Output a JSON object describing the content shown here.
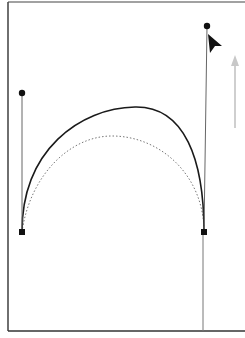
{
  "diagram": {
    "colors": {
      "frame": "#333333",
      "curve": "#1a1a1a",
      "dotted_curve": "#777777",
      "handle_line": "#666666",
      "anchor": "#111111",
      "cursor": "#111111",
      "drag_arrow": "#c8c8c8"
    },
    "frame": {
      "left": 8,
      "top": 2,
      "bottom": 331
    },
    "anchors": [
      {
        "name": "left-anchor",
        "x": 22,
        "y": 232
      },
      {
        "name": "right-anchor",
        "x": 204,
        "y": 232
      }
    ],
    "handles": [
      {
        "name": "left-handle",
        "from": [
          22,
          232
        ],
        "to": [
          22,
          93
        ]
      },
      {
        "name": "right-handle",
        "from": [
          204,
          232
        ],
        "to": [
          207,
          26
        ]
      }
    ],
    "curves": {
      "new_path": "M22,232 C22,150 80,108 135,107 C185,106 204,160 204,232",
      "old_path": "M22,232 C30,175 70,136 112,136 C160,136 204,175 204,232"
    },
    "cursor": {
      "x": 208,
      "y": 34
    },
    "drag_arrow": {
      "x": 235,
      "y_start": 128,
      "y_end": 55
    }
  }
}
